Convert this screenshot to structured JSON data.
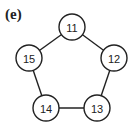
{
  "panel_label": "(e)",
  "nodes": [
    {
      "id": "11",
      "x": 72,
      "y": 27
    },
    {
      "id": "12",
      "x": 114,
      "y": 58
    },
    {
      "id": "13",
      "x": 97,
      "y": 108
    },
    {
      "id": "14",
      "x": 46,
      "y": 108
    },
    {
      "id": "15",
      "x": 29,
      "y": 58
    }
  ],
  "edges": [
    [
      "11",
      "12"
    ],
    [
      "12",
      "13"
    ],
    [
      "13",
      "14"
    ],
    [
      "14",
      "15"
    ],
    [
      "15",
      "11"
    ]
  ]
}
